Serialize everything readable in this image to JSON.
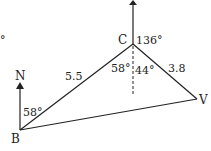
{
  "diagram": {
    "type": "bearing-triangle",
    "points": {
      "B": {
        "label": "B"
      },
      "C": {
        "label": "C"
      },
      "V": {
        "label": "V"
      }
    },
    "north_label": "N",
    "stray_mark": "°",
    "sides": {
      "BC": "5.5",
      "CV": "3.8"
    },
    "angles": {
      "B_bearing": "58°",
      "C_bearing": "136°",
      "C_left": "58°",
      "C_right": "44°"
    },
    "colors": {
      "line": "#222222",
      "background": "#ffffff"
    }
  }
}
